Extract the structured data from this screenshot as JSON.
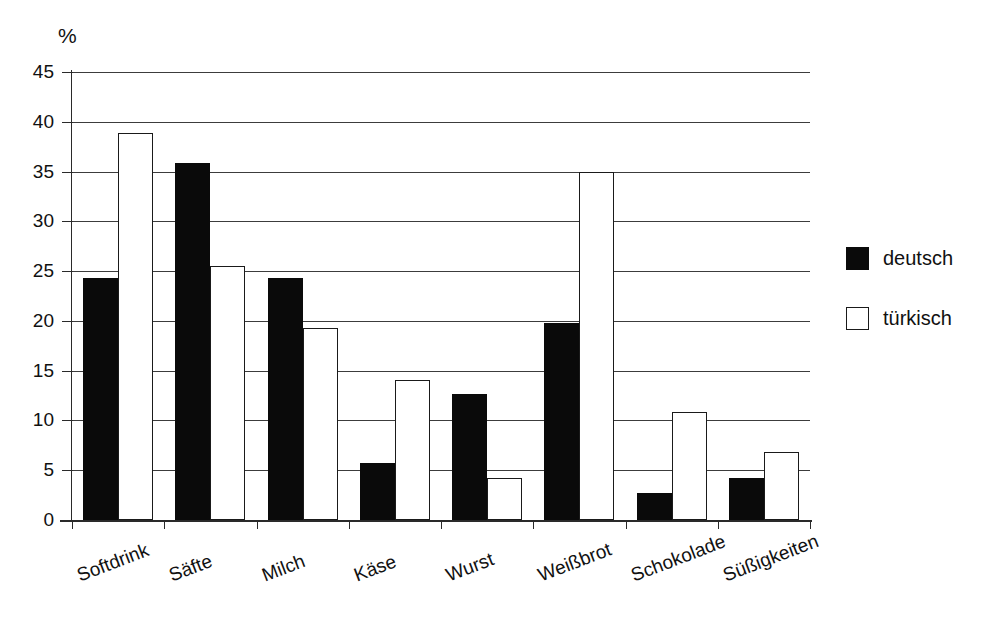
{
  "chart_data": {
    "type": "bar",
    "title": "",
    "subtitle": "",
    "xlabel": "",
    "ylabel": "%",
    "unit_label": "%",
    "ylim": [
      0,
      45
    ],
    "ytick_step": 5,
    "yticks": [
      0,
      5,
      10,
      15,
      20,
      25,
      30,
      35,
      40,
      45
    ],
    "ytick_labels": [
      "0",
      "5",
      "10",
      "15",
      "20",
      "25",
      "30",
      "35",
      "40",
      "45"
    ],
    "grid": "horizontal",
    "legend_position": "right",
    "categories": [
      "Softdrink",
      "Säfte",
      "Milch",
      "Käse",
      "Wurst",
      "Weißbrot",
      "Schokolade",
      "Süßigkeiten"
    ],
    "series": [
      {
        "name": "deutsch",
        "color": "#0a0a0a",
        "fill": "solid",
        "values": [
          24.3,
          35.9,
          24.3,
          5.7,
          12.7,
          19.8,
          2.7,
          4.2
        ]
      },
      {
        "name": "türkisch",
        "color": "#ffffff",
        "fill": "hollow",
        "values": [
          38.9,
          25.5,
          19.3,
          14.1,
          4.2,
          35.0,
          10.8,
          6.8
        ]
      }
    ],
    "annotations": [
      "Weißbrot türkisch bar is clipped at the top of the plot area (35)"
    ]
  },
  "legend": {
    "items": [
      {
        "label": "deutsch",
        "swatch": "filled"
      },
      {
        "label": "türkisch",
        "swatch": "hollow"
      }
    ]
  },
  "colors": {
    "series_deutsch": "#0a0a0a",
    "series_tuerkisch": "#ffffff",
    "axis": "#2a2a2a",
    "grid": "#3c3c3c",
    "background": "#ffffff"
  }
}
